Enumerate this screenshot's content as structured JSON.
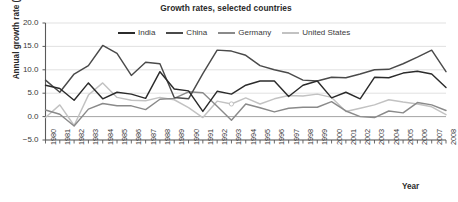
{
  "chart_data": {
    "type": "line",
    "title": "Growth rates, selected countries",
    "xlabel": "Year",
    "ylabel": "Annual growth rate (%)",
    "ylim": [
      -5.0,
      20.0
    ],
    "ytick_labels": [
      "20.0",
      "15.0",
      "10.0",
      "5.0",
      "0.0",
      "−5.0"
    ],
    "ytick_values": [
      20.0,
      15.0,
      10.0,
      5.0,
      0.0,
      -5.0
    ],
    "grid": "horizontal",
    "legend_position": "top-center-inside",
    "x": [
      1980,
      1981,
      1982,
      1983,
      1984,
      1985,
      1986,
      1987,
      1988,
      1989,
      1990,
      1991,
      1992,
      1993,
      1994,
      1995,
      1996,
      1997,
      1998,
      1999,
      2000,
      2001,
      2002,
      2003,
      2004,
      2005,
      2006,
      2007,
      2008
    ],
    "categories": [
      "1980",
      "1981",
      "1982",
      "1983",
      "1984",
      "1985",
      "1986",
      "1987",
      "1988",
      "1989",
      "1990",
      "1991",
      "1992",
      "1993",
      "1994",
      "1995",
      "1996",
      "1997",
      "1998",
      "1999",
      "2000",
      "2001",
      "2002",
      "2003",
      "2004",
      "2005",
      "2006",
      "2007",
      "2008"
    ],
    "series": [
      {
        "name": "India",
        "color": "#2b2b2b",
        "values": [
          6.7,
          6.0,
          3.5,
          7.2,
          3.8,
          5.2,
          4.8,
          3.9,
          9.6,
          5.9,
          5.5,
          1.1,
          5.4,
          4.8,
          6.7,
          7.6,
          7.6,
          4.3,
          6.7,
          7.6,
          4.0,
          5.2,
          3.8,
          8.4,
          8.3,
          9.3,
          9.7,
          9.1,
          6.2
        ]
      },
      {
        "name": "China",
        "color": "#4a4a4a",
        "values": [
          7.8,
          5.2,
          9.1,
          10.9,
          15.2,
          13.5,
          8.8,
          11.6,
          11.3,
          4.1,
          3.8,
          9.2,
          14.2,
          14.0,
          13.1,
          10.9,
          10.0,
          9.3,
          7.8,
          7.6,
          8.4,
          8.3,
          9.1,
          10.0,
          10.1,
          11.3,
          12.7,
          14.2,
          9.6
        ]
      },
      {
        "name": "Germany",
        "color": "#8a8a8a",
        "values": [
          1.4,
          0.5,
          -2.0,
          1.6,
          2.8,
          2.3,
          2.3,
          1.5,
          3.7,
          3.9,
          5.3,
          5.1,
          2.2,
          -0.8,
          2.7,
          1.9,
          1.0,
          1.8,
          2.0,
          2.0,
          3.2,
          1.2,
          0.0,
          -0.2,
          1.2,
          0.8,
          3.0,
          2.5,
          1.3
        ]
      },
      {
        "name": "United States",
        "color": "#c2c2c2",
        "values": [
          -0.2,
          2.5,
          -1.9,
          4.6,
          7.2,
          4.1,
          3.5,
          3.4,
          4.1,
          3.6,
          1.9,
          -0.2,
          3.3,
          2.7,
          4.0,
          2.7,
          3.8,
          4.5,
          4.4,
          4.8,
          4.1,
          1.1,
          1.8,
          2.5,
          3.6,
          3.1,
          2.7,
          2.1,
          0.4
        ]
      }
    ]
  },
  "legend": {
    "entries": [
      {
        "label": "India",
        "color": "#2b2b2b"
      },
      {
        "label": "China",
        "color": "#4a4a4a"
      },
      {
        "label": "Germany",
        "color": "#8a8a8a"
      },
      {
        "label": "United States",
        "color": "#c2c2c2"
      }
    ]
  },
  "axes": {
    "y_label": "Annual growth rate (%)",
    "x_label": "Year"
  },
  "colors": {
    "background": "#ffffff",
    "axis": "#5a5a5a",
    "gridline": "#d9d9d9",
    "zero_line": "#9a9a9a",
    "text": "#3a3a3a"
  }
}
